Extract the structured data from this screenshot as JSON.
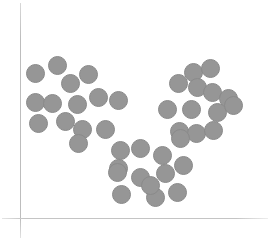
{
  "chart_data": {
    "type": "scatter",
    "title": "",
    "subtitle": "",
    "xlabel": "",
    "ylabel": "",
    "xticklabels": [],
    "yticklabels": [],
    "grid": false,
    "legend": null,
    "legend_position": "none",
    "axis_style": "left-and-bottom-spines-only",
    "axis_color": "#c4c4c4",
    "marker": {
      "shape": "circle",
      "diameter_px": 19,
      "fill_color": "#969696",
      "edge_color": "#8a8a8a",
      "opacity": 1
    },
    "xlim": [
      0,
      275
    ],
    "ylim": [
      0,
      246
    ],
    "n_points": 40,
    "n_clusters": 3,
    "series": [
      {
        "name": "cluster-1",
        "label": "upper-left cluster",
        "color": "#969696",
        "n": 14,
        "points": [
          {
            "x": 35,
            "y": 73
          },
          {
            "x": 57,
            "y": 65
          },
          {
            "x": 70,
            "y": 83
          },
          {
            "x": 88,
            "y": 74
          },
          {
            "x": 35,
            "y": 102
          },
          {
            "x": 52,
            "y": 103
          },
          {
            "x": 77,
            "y": 104
          },
          {
            "x": 98,
            "y": 97
          },
          {
            "x": 118,
            "y": 100
          },
          {
            "x": 38,
            "y": 123
          },
          {
            "x": 65,
            "y": 121
          },
          {
            "x": 82,
            "y": 129
          },
          {
            "x": 105,
            "y": 129
          },
          {
            "x": 78,
            "y": 143
          }
        ]
      },
      {
        "name": "cluster-2",
        "label": "right cluster",
        "color": "#969696",
        "n": 13,
        "points": [
          {
            "x": 193,
            "y": 72
          },
          {
            "x": 210,
            "y": 68
          },
          {
            "x": 178,
            "y": 83
          },
          {
            "x": 197,
            "y": 87
          },
          {
            "x": 212,
            "y": 92
          },
          {
            "x": 228,
            "y": 98
          },
          {
            "x": 167,
            "y": 109
          },
          {
            "x": 191,
            "y": 109
          },
          {
            "x": 217,
            "y": 112
          },
          {
            "x": 233,
            "y": 105
          },
          {
            "x": 179,
            "y": 131
          },
          {
            "x": 196,
            "y": 133
          },
          {
            "x": 213,
            "y": 130
          }
        ]
      },
      {
        "name": "cluster-3",
        "label": "lower-middle cluster",
        "color": "#969696",
        "n": 13,
        "points": [
          {
            "x": 180,
            "y": 138
          },
          {
            "x": 120,
            "y": 150
          },
          {
            "x": 140,
            "y": 148
          },
          {
            "x": 162,
            "y": 155
          },
          {
            "x": 118,
            "y": 168
          },
          {
            "x": 165,
            "y": 173
          },
          {
            "x": 140,
            "y": 177
          },
          {
            "x": 117,
            "y": 172
          },
          {
            "x": 121,
            "y": 194
          },
          {
            "x": 155,
            "y": 197
          },
          {
            "x": 177,
            "y": 192
          },
          {
            "x": 183,
            "y": 165
          },
          {
            "x": 150,
            "y": 185
          }
        ]
      }
    ]
  }
}
